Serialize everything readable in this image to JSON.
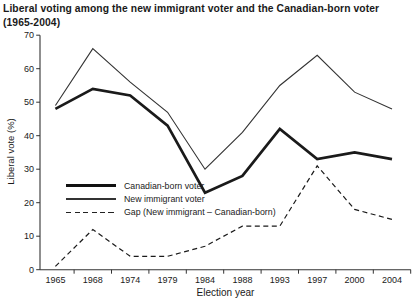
{
  "title": {
    "line1": "Liberal voting among the new immigrant voter and the Canadian-born voter",
    "line2": "(1965-2004)"
  },
  "axes": {
    "y_label": "Liberal vote (%)",
    "x_label": "Election year"
  },
  "legend": {
    "items": [
      {
        "label": "Canadian-born voter",
        "style": "thick-solid"
      },
      {
        "label": "New immigrant voter",
        "style": "thin-solid"
      },
      {
        "label": "Gap (New immigrant – Canadian-born)",
        "style": "dashed"
      }
    ]
  },
  "chart_data": {
    "type": "line",
    "x": [
      1965,
      1968,
      1974,
      1979,
      1984,
      1988,
      1993,
      1997,
      2000,
      2004
    ],
    "series": [
      {
        "name": "New immigrant voter",
        "style": "thin-solid",
        "values": [
          49,
          66,
          56,
          47,
          30,
          41,
          55,
          64,
          53,
          48
        ]
      },
      {
        "name": "Canadian-born voter",
        "style": "thick-solid",
        "values": [
          48,
          54,
          52,
          43,
          23,
          28,
          42,
          33,
          35,
          33
        ]
      },
      {
        "name": "Gap (New immigrant - Canadian-born)",
        "style": "dashed",
        "values": [
          1,
          12,
          4,
          4,
          7,
          13,
          13,
          31,
          18,
          15
        ]
      }
    ],
    "title": "Liberal voting among the new immigrant voter and the Canadian-born voter (1965-2004)",
    "xlabel": "Election year",
    "ylabel": "Liberal vote (%)",
    "ylim": [
      0,
      70
    ],
    "y_tick_step": 10,
    "grid": false,
    "legend_position": "inside-left-middle"
  },
  "colors": {
    "line": "#1a1a1a",
    "thin_line": "#333333",
    "axis": "#333333",
    "text": "#1a1a1a",
    "background": "#ffffff"
  }
}
